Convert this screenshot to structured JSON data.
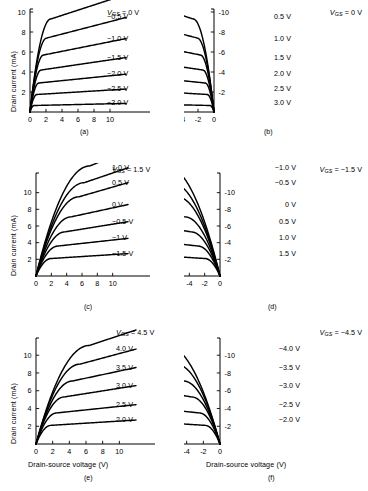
{
  "figure": {
    "axis_titles": {
      "y": "Drain current (mA)",
      "x": "Drain-source voltage (V)"
    },
    "vgs_symbol_main": "V",
    "vgs_symbol_sub": "GS"
  },
  "chart_data": [
    {
      "type": "line",
      "panel": "a",
      "caption": "(a)",
      "title": "",
      "xlabel": "Drain-source voltage (V)",
      "ylabel": "Drain current (mA)",
      "xlim": [
        0,
        12
      ],
      "ylim": [
        0,
        10
      ],
      "xticks": [
        0,
        2,
        4,
        6,
        8,
        10
      ],
      "yticks": [
        0,
        2,
        4,
        6,
        8,
        10
      ],
      "xticklabels": [
        "0",
        "2",
        "4",
        "6",
        "8",
        "10"
      ],
      "yticklabels": [
        "0",
        "2",
        "4",
        "6",
        "8",
        "10"
      ],
      "grid": false,
      "legend_position": "right-of-curve-ends",
      "series": [
        {
          "name": "0 V",
          "label": "= 0 V",
          "has_vgs_prefix": true,
          "saturation": 9.3,
          "knee": 2.6
        },
        {
          "name": "-0.5 V",
          "label": "-0.5 V",
          "has_vgs_prefix": false,
          "saturation": 7.4,
          "knee": 2.1
        },
        {
          "name": "-1.0 V",
          "label": "-1.0 V",
          "has_vgs_prefix": false,
          "saturation": 5.7,
          "knee": 1.7
        },
        {
          "name": "-1.5 V",
          "label": "-1.5 V",
          "has_vgs_prefix": false,
          "saturation": 4.2,
          "knee": 1.4
        },
        {
          "name": "-2.0 V",
          "label": "-2.0 V",
          "has_vgs_prefix": false,
          "saturation": 2.9,
          "knee": 1.1
        },
        {
          "name": "-2.5 V",
          "label": "-2.5 V",
          "has_vgs_prefix": false,
          "saturation": 1.75,
          "knee": 0.85
        },
        {
          "name": "-3.0 V",
          "label": "-3.0 V",
          "has_vgs_prefix": false,
          "saturation": 0.65,
          "knee": 0.5
        }
      ]
    },
    {
      "type": "line",
      "panel": "b",
      "caption": "(b)",
      "title": "",
      "xlabel": "Drain-source voltage (V)",
      "ylabel": "Drain current (mA)",
      "xlim": [
        0,
        -12
      ],
      "ylim": [
        0,
        -10
      ],
      "xticks": [
        0,
        -2,
        -4,
        -6,
        -8,
        -10
      ],
      "yticks": [
        0,
        -2,
        -4,
        -6,
        -8,
        -10
      ],
      "xticklabels": [
        "0",
        "-2",
        "-4",
        "-6",
        "-8",
        "-10"
      ],
      "yticklabels": [
        "0",
        "-2",
        "-4",
        "-6",
        "-8",
        "-10"
      ],
      "grid": false,
      "legend_position": "right-of-curve-ends",
      "series": [
        {
          "name": "0 V",
          "label": "= 0 V",
          "has_vgs_prefix": true,
          "saturation": 9.3,
          "knee": 2.6
        },
        {
          "name": "0.5 V",
          "label": "0.5 V",
          "has_vgs_prefix": false,
          "saturation": 7.4,
          "knee": 2.1
        },
        {
          "name": "1.0 V",
          "label": "1.0 V",
          "has_vgs_prefix": false,
          "saturation": 5.7,
          "knee": 1.7
        },
        {
          "name": "1.5 V",
          "label": "1.5 V",
          "has_vgs_prefix": false,
          "saturation": 4.2,
          "knee": 1.4
        },
        {
          "name": "2.0 V",
          "label": "2.0 V",
          "has_vgs_prefix": false,
          "saturation": 2.9,
          "knee": 1.1
        },
        {
          "name": "2.5 V",
          "label": "2.5 V",
          "has_vgs_prefix": false,
          "saturation": 1.75,
          "knee": 0.85
        },
        {
          "name": "3.0 V",
          "label": "3.0 V",
          "has_vgs_prefix": false,
          "saturation": 0.65,
          "knee": 0.5
        }
      ]
    },
    {
      "type": "line",
      "panel": "c",
      "caption": "(c)",
      "title": "",
      "xlabel": "Drain-source voltage (V)",
      "ylabel": "Drain current (mA)",
      "xlim": [
        0,
        12
      ],
      "ylim": [
        0,
        12
      ],
      "xticks": [
        0,
        2,
        4,
        6,
        8,
        10
      ],
      "yticks": [
        0,
        2,
        4,
        6,
        8,
        10
      ],
      "xticklabels": [
        "0",
        "2",
        "4",
        "6",
        "8",
        "10"
      ],
      "yticklabels": [
        "0",
        "2",
        "4",
        "6",
        "8",
        "10"
      ],
      "grid": false,
      "legend_position": "right-of-curve-ends",
      "series": [
        {
          "name": "1.5 V",
          "label": "= 1.5 V",
          "has_vgs_prefix": true,
          "saturation": 13.2,
          "knee": 7.0
        },
        {
          "name": "1.0 V",
          "label": "1.0 V",
          "has_vgs_prefix": false,
          "saturation": 11.2,
          "knee": 6.3
        },
        {
          "name": "0.5 V",
          "label": "0.5 V",
          "has_vgs_prefix": false,
          "saturation": 9.5,
          "knee": 5.6
        },
        {
          "name": "0 V",
          "label": "0 V",
          "has_vgs_prefix": false,
          "saturation": 7.1,
          "knee": 4.6
        },
        {
          "name": "-0.5 V",
          "label": "-0.5 V",
          "has_vgs_prefix": false,
          "saturation": 5.3,
          "knee": 3.8
        },
        {
          "name": "-1 V",
          "label": "-1 V",
          "has_vgs_prefix": false,
          "saturation": 3.6,
          "knee": 2.9
        },
        {
          "name": "-1.5 V",
          "label": "-1.5 V",
          "has_vgs_prefix": false,
          "saturation": 2.1,
          "knee": 2.0
        }
      ]
    },
    {
      "type": "line",
      "panel": "d",
      "caption": "(d)",
      "title": "",
      "xlabel": "Drain-source voltage (V)",
      "ylabel": "Drain current (mA)",
      "xlim": [
        0,
        -12
      ],
      "ylim": [
        0,
        -12
      ],
      "xticks": [
        0,
        -2,
        -4,
        -6,
        -8,
        -10
      ],
      "yticks": [
        0,
        -2,
        -4,
        -6,
        -8,
        -10
      ],
      "xticklabels": [
        "0",
        "-2",
        "-4",
        "-6",
        "-8",
        "-10"
      ],
      "yticklabels": [
        "0",
        "-2",
        "-4",
        "-6",
        "-8",
        "-10"
      ],
      "grid": false,
      "legend_position": "right-of-curve-ends",
      "series": [
        {
          "name": "-1.5 V",
          "label": "= -1.5 V",
          "has_vgs_prefix": true,
          "saturation": 13.2,
          "knee": 7.0
        },
        {
          "name": "-1.0 V",
          "label": "-1.0 V",
          "has_vgs_prefix": false,
          "saturation": 11.2,
          "knee": 6.3
        },
        {
          "name": "-0.5 V",
          "label": "-0.5 V",
          "has_vgs_prefix": false,
          "saturation": 9.5,
          "knee": 5.6
        },
        {
          "name": "0 V",
          "label": "0 V",
          "has_vgs_prefix": false,
          "saturation": 7.1,
          "knee": 4.6
        },
        {
          "name": "0.5 V",
          "label": "0.5 V",
          "has_vgs_prefix": false,
          "saturation": 5.3,
          "knee": 3.8
        },
        {
          "name": "1.0 V",
          "label": "1.0 V",
          "has_vgs_prefix": false,
          "saturation": 3.6,
          "knee": 2.9
        },
        {
          "name": "1.5 V",
          "label": "1.5 V",
          "has_vgs_prefix": false,
          "saturation": 2.1,
          "knee": 2.0
        }
      ]
    },
    {
      "type": "line",
      "panel": "e",
      "caption": "(e)",
      "title": "",
      "xlabel": "Drain-source voltage (V)",
      "ylabel": "Drain current (mA)",
      "xlim": [
        0,
        12
      ],
      "ylim": [
        0,
        11
      ],
      "xticks": [
        0,
        2,
        4,
        6,
        8,
        10
      ],
      "yticks": [
        0,
        2,
        4,
        6,
        8,
        10
      ],
      "xticklabels": [
        "0",
        "2",
        "4",
        "6",
        "8",
        "10"
      ],
      "yticklabels": [
        "0",
        "2",
        "4",
        "6",
        "8",
        "10"
      ],
      "grid": false,
      "legend_position": "right-of-curve-ends",
      "series": [
        {
          "name": "4.5 V",
          "label": "= 4.5 V",
          "has_vgs_prefix": true,
          "saturation": 11.1,
          "knee": 6.4
        },
        {
          "name": "4.0 V",
          "label": "4.0 V",
          "has_vgs_prefix": false,
          "saturation": 9.0,
          "knee": 5.3
        },
        {
          "name": "3.5 V",
          "label": "3.5 V",
          "has_vgs_prefix": false,
          "saturation": 7.1,
          "knee": 4.4
        },
        {
          "name": "3.0 V",
          "label": "3.0 V",
          "has_vgs_prefix": false,
          "saturation": 5.3,
          "knee": 3.4
        },
        {
          "name": "2.5 V",
          "label": "2.5 V",
          "has_vgs_prefix": false,
          "saturation": 3.5,
          "knee": 2.5
        },
        {
          "name": "2.0 V",
          "label": "2.0 V",
          "has_vgs_prefix": false,
          "saturation": 2.1,
          "knee": 1.8
        }
      ]
    },
    {
      "type": "line",
      "panel": "f",
      "caption": "(f)",
      "title": "",
      "xlabel": "Drain-source voltage (V)",
      "ylabel": "Drain current (mA)",
      "xlim": [
        0,
        -12
      ],
      "ylim": [
        0,
        -11
      ],
      "xticks": [
        0,
        -2,
        -4,
        -6,
        -8,
        -10
      ],
      "yticks": [
        0,
        -2,
        -4,
        -6,
        -8,
        -10
      ],
      "xticklabels": [
        "0",
        "-2",
        "-4",
        "-6",
        "-8",
        "-10"
      ],
      "yticklabels": [
        "0",
        "-2",
        "-4",
        "-6",
        "-8",
        "-10"
      ],
      "grid": false,
      "legend_position": "right-of-curve-ends",
      "series": [
        {
          "name": "-4.5 V",
          "label": "= -4.5 V",
          "has_vgs_prefix": true,
          "saturation": 11.1,
          "knee": 6.4
        },
        {
          "name": "-4.0 V",
          "label": "-4.0 V",
          "has_vgs_prefix": false,
          "saturation": 9.0,
          "knee": 5.3
        },
        {
          "name": "-3.5 V",
          "label": "-3.5 V",
          "has_vgs_prefix": false,
          "saturation": 7.1,
          "knee": 4.4
        },
        {
          "name": "-3.0 V",
          "label": "-3.0 V",
          "has_vgs_prefix": false,
          "saturation": 5.3,
          "knee": 3.4
        },
        {
          "name": "-2.5 V",
          "label": "-2.5 V",
          "has_vgs_prefix": false,
          "saturation": 3.5,
          "knee": 2.5
        },
        {
          "name": "-2.0 V",
          "label": "-2.0 V",
          "has_vgs_prefix": false,
          "saturation": 2.1,
          "knee": 1.8
        }
      ]
    }
  ]
}
